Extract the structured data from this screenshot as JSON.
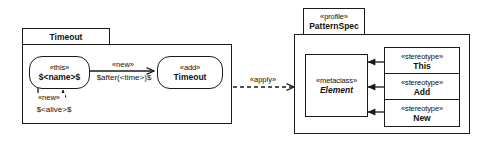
{
  "diagram": {
    "line_color": "#1a1a1a",
    "background": "#ffffff"
  },
  "left_package": {
    "tab_label": "Timeout",
    "states": [
      {
        "id": "this-state",
        "stereotype": "«this»",
        "name": "$<name>$"
      },
      {
        "id": "add-state",
        "stereotype": "«add»",
        "name": "Timeout"
      }
    ],
    "transitions": [
      {
        "id": "new-after-transition",
        "stereotype": "«new»",
        "guard": "$after(<time>)$"
      },
      {
        "id": "new-alive-selfloop",
        "stereotype": "«new»",
        "guard": "$<alive>$"
      }
    ]
  },
  "apply_link": {
    "label": "«apply»"
  },
  "right_package": {
    "tab_stereotype": "«profile»",
    "tab_label": "PatternSpec",
    "metaclass": {
      "stereotype": "«metaclass»",
      "name": "Element"
    },
    "stereotypes": [
      {
        "stereotype": "«stereotype»",
        "name": "This"
      },
      {
        "stereotype": "«stereotype»",
        "name": "Add"
      },
      {
        "stereotype": "«stereotype»",
        "name": "New"
      }
    ]
  }
}
